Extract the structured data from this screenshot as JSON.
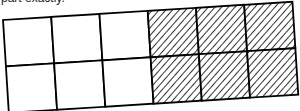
{
  "caption": "part exactly.",
  "diagram": {
    "type": "fraction-grid",
    "rows": 2,
    "cols": 6,
    "shaded_cols": [
      3,
      4,
      5
    ],
    "shaded_cells": 6,
    "total_cells": 12,
    "shading": "diagonal-hatch",
    "stroke_color": "#000000",
    "fill_color": "#ffffff"
  }
}
